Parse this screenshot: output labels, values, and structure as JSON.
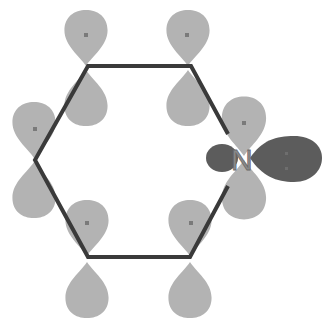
{
  "diagram": {
    "heteroatom_label": "N",
    "colors": {
      "p_orbital": "#b3b3b3",
      "lone_pair_orbital": "#5c5c5c",
      "bond": "#3a3a3a",
      "electron_dot": "#7a7a7a",
      "background": "#ffffff"
    },
    "ring": {
      "shape": "hexagon",
      "vertices": [
        {
          "name": "C-top-left",
          "x": 88,
          "y": 66
        },
        {
          "name": "C-top-right",
          "x": 191,
          "y": 66
        },
        {
          "name": "N-right",
          "x": 241,
          "y": 158
        },
        {
          "name": "C-bottom-right",
          "x": 190,
          "y": 257
        },
        {
          "name": "C-bottom-left",
          "x": 88,
          "y": 257
        },
        {
          "name": "C-left",
          "x": 35,
          "y": 160
        }
      ]
    },
    "p_orbitals": [
      {
        "atom": "C-top-left",
        "electrons": 1
      },
      {
        "atom": "C-top-right",
        "electrons": 1
      },
      {
        "atom": "N-right",
        "electrons": 1
      },
      {
        "atom": "C-bottom-right",
        "electrons": 1
      },
      {
        "atom": "C-bottom-left",
        "electrons": 1
      },
      {
        "atom": "C-left",
        "electrons": 1
      }
    ],
    "lone_pair": {
      "atom": "N-right",
      "electrons": 2,
      "direction": "right"
    }
  }
}
